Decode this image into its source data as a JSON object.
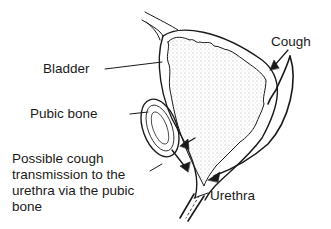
{
  "diagram": {
    "type": "anatomical line drawing",
    "labels": {
      "bladder": "Bladder",
      "pubic_bone": "Pubic bone",
      "cough": "Cough",
      "urethra": "Urethra",
      "possible": "Possible cough transmission to the urethra via the pubic bone"
    },
    "colors": {
      "line": "#1a1a1a",
      "background": "#ffffff",
      "stipple": "#555555"
    }
  }
}
